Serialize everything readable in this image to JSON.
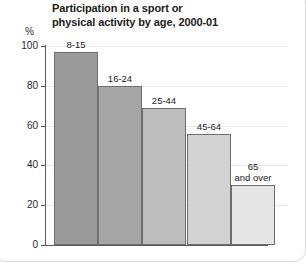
{
  "chart_data": {
    "type": "bar",
    "title": "Participation in a sport or\nphysical activity by age, 2000-01",
    "title_line1": "Participation in a sport or",
    "title_line2": "physical activity by age, 2000-01",
    "xlabel": "",
    "ylabel": "%",
    "ylim": [
      0,
      100
    ],
    "yticks": [
      0,
      20,
      40,
      60,
      80,
      100
    ],
    "ytick_labels": [
      "0",
      "20",
      "40",
      "60",
      "80",
      "100"
    ],
    "grid": true,
    "legend": "none",
    "categories": [
      "8-15",
      "16-24",
      "25-44",
      "45-64",
      "65 and over"
    ],
    "values": [
      97,
      80,
      69,
      56,
      30
    ],
    "bars": [
      {
        "label": "8-15",
        "value": 97,
        "color": "#9a9a9a"
      },
      {
        "label": "16-24",
        "value": 80,
        "color": "#a6a6a6"
      },
      {
        "label": "25-44",
        "value": 69,
        "color": "#bdbdbd"
      },
      {
        "label": "45-64",
        "value": 56,
        "color": "#d2d2d2"
      },
      {
        "label": "65\nand over",
        "value": 30,
        "color": "#e6e6e6"
      }
    ]
  }
}
